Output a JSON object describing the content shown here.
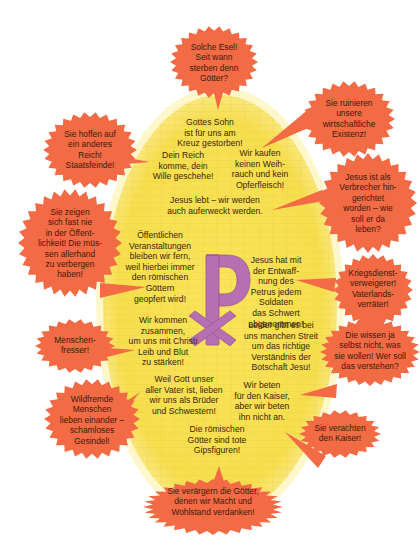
{
  "colors": {
    "ellipse_fill": "#f7e35a",
    "ellipse_glow": "#fdf3b0",
    "bubble_fill": "#f26b45",
    "chi_rho": "#b66fb0",
    "text": "#3a2410"
  },
  "center_symbol": {
    "icon": "chi-rho-icon",
    "description": "Christogram (Chi-Rho)"
  },
  "christian_statements": [
    {
      "id": "gottes-sohn",
      "text": "Gottes Sohn\nist für uns am\nKreuz gestorben!"
    },
    {
      "id": "dein-reich",
      "text": "Dein Reich\nkomme, dein\nWille geschehe!"
    },
    {
      "id": "weihrauch",
      "text": "Wir kaufen\nkeinen Weih-\nrauch und kein\nOpferfleisch!"
    },
    {
      "id": "jesus-lebt",
      "text": "Jesus lebt – wir werden\nauch auferweckt werden."
    },
    {
      "id": "veranstaltungen",
      "text": "Öffentlichen\nVeranstaltungen\nbleiben wir fern,\nweil hierbei immer\nden römischen\nGöttern\ngeopfert wird!"
    },
    {
      "id": "entwaffnung",
      "text": "Jesus hat mit\nder Entwaff-\nnung des\nPetrus jedem\nSoldaten\ndas Schwert\nabgenommen!"
    },
    {
      "id": "zusammen",
      "text": "Wir kommen\nzusammen,\num uns mit Christi\nLeib und Blut\nzu stärken!"
    },
    {
      "id": "streit",
      "text": "Leider gibt es bei\nuns manchen Streit\num das richtige\nVerständnis der\nBotschaft Jesu!"
    },
    {
      "id": "brueder",
      "text": "Weil Gott unser\naller Vater ist, lieben\nwir uns als Brüder\nund Schwestern!"
    },
    {
      "id": "kaiser",
      "text": "Wir beten\nfür den Kaiser,\naber wir beten\nihn nicht an."
    },
    {
      "id": "gipsfiguren",
      "text": "Die römischen\nGötter sind tote\nGipsfiguren!"
    }
  ],
  "accusations": [
    {
      "id": "esel",
      "text": "Solche Esel!\nSeit wann\nsterben denn\nGötter?"
    },
    {
      "id": "existenz",
      "text": "Sie ruinieren\nunsere\nwirtschaftliche\nExistenz!"
    },
    {
      "id": "staatsfeinde",
      "text": "Sie hoffen auf\nein anderes\nReich!\nStaatsfeinde!"
    },
    {
      "id": "verbrecher",
      "text": "Jesus ist als\nVerbrecher hin-\ngerichtet\nworden – wie\nsoll er da\nleben?"
    },
    {
      "id": "oeffentlichkeit",
      "text": "Sie zeigen\nsich fast nie\nin der Öffent-\nlichkeit! Die müs-\nsen allerhand\nzu verbergen\nhaben!"
    },
    {
      "id": "kriegsdienst",
      "text": "Kriegsdienst-\nverweigerer!\nVaterlands-\nverräter!"
    },
    {
      "id": "menschenfresser",
      "text": "Menschen-\nfresser!"
    },
    {
      "id": "verstehen",
      "text": "Die wissen ja\nselbst nicht, was\nsie wollen! Wer soll\ndas verstehen?"
    },
    {
      "id": "gesindel",
      "text": "Wildfremde\nMenschen\nlieben einander –\nschamloses\nGesindel!"
    },
    {
      "id": "verachten",
      "text": "Sie verachten\nden Kaiser!"
    },
    {
      "id": "veraergern",
      "text": "Sie verärgern die Götter,\ndenen wir Macht und\nWohlstand verdanken!"
    }
  ]
}
